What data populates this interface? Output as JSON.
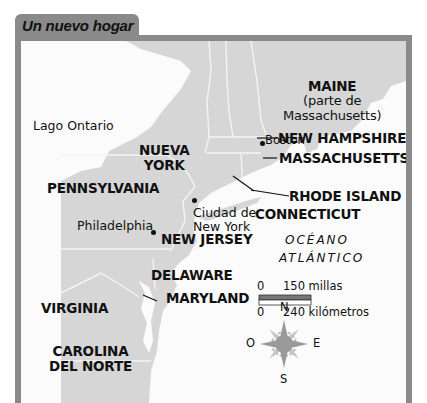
{
  "map": {
    "title": "Un nuevo hogar",
    "water_labels": {
      "lake": "Lago Ontario",
      "ocean_line1": "OCÉANO",
      "ocean_line2": "ATLÁNTICO"
    },
    "states": {
      "maine_line1": "MAINE",
      "maine_line2": "(parte de",
      "maine_line3": "Massachusetts)",
      "new_hampshire": "NEW HAMPSHIRE",
      "massachusetts": "MASSACHUSETTS",
      "rhode_island": "RHODE ISLAND",
      "connecticut": "CONNECTICUT",
      "nueva_york_line1": "NUEVA",
      "nueva_york_line2": "YORK",
      "pennsylvania": "PENNSYLVANIA",
      "new_jersey": "NEW JERSEY",
      "delaware": "DELAWARE",
      "maryland": "MARYLAND",
      "virginia": "VIRGINIA",
      "carolina_line1": "CAROLINA",
      "carolina_line2": "DEL NORTE"
    },
    "cities": {
      "boston": "Boston",
      "philadelphia": "Philadelphia",
      "nyc_line1": "Ciudad de",
      "nyc_line2": "New York"
    },
    "scale": {
      "miles_zero": "0",
      "miles_label": "150 millas",
      "km_zero": "0",
      "km_label": "240 kilómetros"
    },
    "compass": {
      "north": "N",
      "south": "S",
      "east": "E",
      "west": "O"
    },
    "colors": {
      "frame": "#8a8a8a",
      "land": "#d6d6d6",
      "water": "#fbfbfb",
      "border": "#f4f4f4",
      "compass_center": "#9a9a9a"
    }
  }
}
